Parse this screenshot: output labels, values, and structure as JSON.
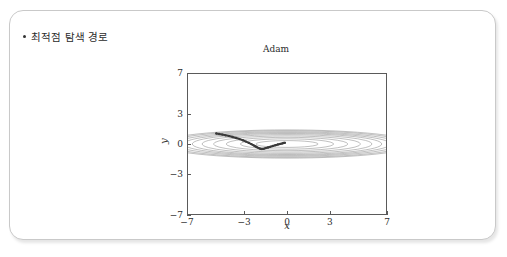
{
  "slide": {
    "bullet_text": "최적점 탐색 경로",
    "card_border_color": "#c9c9c9",
    "background_color": "#ffffff"
  },
  "chart_data": {
    "type": "line",
    "title": "Adam",
    "xlabel": "x",
    "ylabel": "y",
    "xlim": [
      -7,
      7
    ],
    "ylim": [
      -7,
      7
    ],
    "xticks": [
      -7,
      -3,
      0,
      3,
      7
    ],
    "xticklabels": [
      "−7",
      "−3",
      "0",
      "3",
      "7"
    ],
    "yticks": [
      -7,
      -3,
      0,
      3,
      7
    ],
    "yticklabels": [
      "−7",
      "−3",
      "0",
      "3",
      "7"
    ],
    "grid": false,
    "legend": false,
    "axis_color": "#5a5a5a",
    "contour_color": "#8a8a8a",
    "path_color": "#3a3a3a",
    "contours": {
      "description": "concentric flattened ellipses of f(x,y) = x^2/20 + y^2 centered at origin",
      "center": [
        0,
        0
      ],
      "aspect_ratio": 6.4,
      "levels": [
        0.12,
        0.3,
        0.55,
        0.85,
        1.2,
        1.6,
        2.05,
        2.55,
        3.1,
        3.7
      ],
      "semi_axes_x": [
        2.2,
        3.3,
        4.3,
        5.2,
        6.0,
        6.7,
        7.3,
        7.9,
        8.5,
        9.0
      ],
      "semi_axes_y": [
        0.34,
        0.52,
        0.67,
        0.81,
        0.94,
        1.05,
        1.14,
        1.23,
        1.33,
        1.41
      ]
    },
    "series": [
      {
        "name": "Adam optimization path",
        "marker": "dot",
        "start": [
          -5.0,
          1.05
        ],
        "end": [
          -0.15,
          0.12
        ],
        "x": [
          -5.0,
          -4.8,
          -4.58,
          -4.35,
          -4.1,
          -3.85,
          -3.6,
          -3.35,
          -3.12,
          -2.9,
          -2.7,
          -2.52,
          -2.36,
          -2.22,
          -2.1,
          -2.0,
          -1.92,
          -1.85,
          -1.78,
          -1.7,
          -1.6,
          -1.48,
          -1.34,
          -1.18,
          -1.0,
          -0.82,
          -0.64,
          -0.48,
          -0.34,
          -0.24,
          -0.15
        ],
        "y": [
          1.05,
          1.0,
          0.94,
          0.87,
          0.79,
          0.7,
          0.6,
          0.49,
          0.37,
          0.24,
          0.11,
          -0.02,
          -0.14,
          -0.25,
          -0.34,
          -0.41,
          -0.46,
          -0.49,
          -0.5,
          -0.49,
          -0.46,
          -0.41,
          -0.35,
          -0.28,
          -0.2,
          -0.12,
          -0.05,
          0.01,
          0.06,
          0.1,
          0.12
        ]
      }
    ]
  }
}
